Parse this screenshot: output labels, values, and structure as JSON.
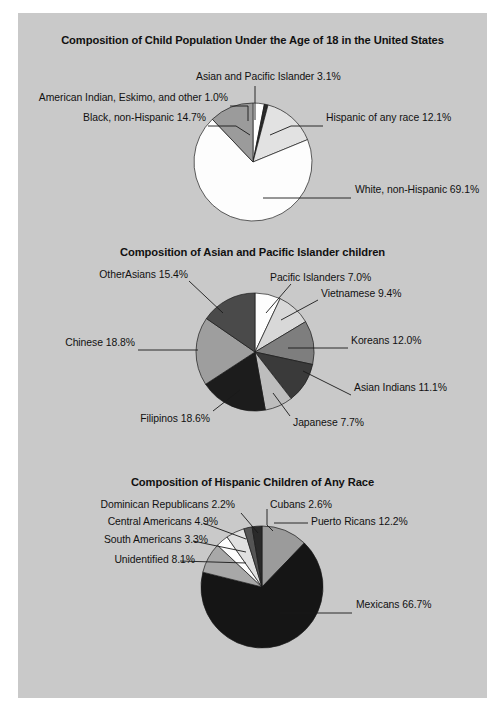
{
  "page": {
    "background_color": "#c9c9c9",
    "text_color": "#111111"
  },
  "chart_data": [
    {
      "type": "pie",
      "title": "Composition of Child Population Under the Age of 18 in the United States",
      "categories": [
        "Asian and Pacific Islander",
        "American Indian, Eskimo, and other",
        "Black, non-Hispanic",
        "White, non-Hispanic",
        "Hispanic of any race"
      ],
      "values": [
        3.1,
        1.0,
        14.7,
        69.1,
        12.1
      ],
      "labels": [
        "Asian and Pacific Islander 3.1%",
        "American Indian, Eskimo, and other 1.0%",
        "Black, non-Hispanic 14.7%",
        "White, non-Hispanic 69.1%",
        "Hispanic of any race 12.1%"
      ],
      "slice_colors": [
        "#ffffff",
        "#2b2b2b",
        "#e2e2e2",
        "#fdfdfd",
        "#9b9b9b"
      ],
      "start_angle": 0,
      "legend": "callout-labels"
    },
    {
      "type": "pie",
      "title": "Composition of Asian and Pacific Islander children",
      "categories": [
        "Pacific Islanders",
        "Vietnamese",
        "Koreans",
        "Asian Indians",
        "Japanese",
        "Filipinos",
        "Chinese",
        "OtherAsians"
      ],
      "values": [
        7.0,
        9.4,
        12.0,
        11.1,
        7.7,
        18.6,
        18.8,
        15.4
      ],
      "labels": [
        "Pacific Islanders 7.0%",
        "Vietnamese 9.4%",
        "Koreans 12.0%",
        "Asian Indians 11.1%",
        "Japanese 7.7%",
        "Filipinos 18.6%",
        "Chinese 18.8%",
        "OtherAsians 15.4%"
      ],
      "slice_colors": [
        "#fdfdfd",
        "#d8d8d8",
        "#7e7e7e",
        "#3a3a3a",
        "#bdbdbd",
        "#1c1c1c",
        "#9e9e9e",
        "#4a4a4a"
      ],
      "start_angle": 0,
      "legend": "callout-labels"
    },
    {
      "type": "pie",
      "title": "Composition of Hispanic Children of Any Race",
      "categories": [
        "Puerto Ricans",
        "Mexicans",
        "Unidentified",
        "South Americans",
        "Central Americans",
        "Dominican Republicans",
        "Cubans"
      ],
      "values": [
        12.2,
        66.7,
        8.1,
        3.3,
        4.9,
        2.2,
        2.6
      ],
      "labels": [
        "Puerto Ricans 12.2%",
        "Mexicans 66.7%",
        "Unidentified 8.1%",
        "South Americans 3.3%",
        "Central Americans 4.9%",
        "Dominican Republicans 2.2%",
        "Cubans 2.6%"
      ],
      "slice_colors": [
        "#9b9b9b",
        "#151515",
        "#a8a8a8",
        "#fdfdfd",
        "#e0e0e0",
        "#555555",
        "#2a2a2a"
      ],
      "start_angle": 0,
      "legend": "callout-labels"
    }
  ]
}
